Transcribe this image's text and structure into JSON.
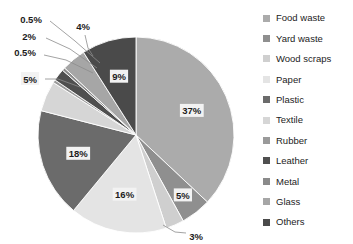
{
  "chart_data": {
    "type": "pie",
    "title": "",
    "categories": [
      "Food waste",
      "Yard waste",
      "Wood scraps",
      "Paper",
      "Plastic",
      "Textile",
      "Rubber",
      "Leather",
      "Metal",
      "Glass",
      "Others"
    ],
    "values": [
      37,
      5,
      3,
      16,
      18,
      5,
      0.5,
      2,
      0.5,
      4,
      9
    ],
    "value_labels": [
      "37%",
      "5%",
      "3%",
      "16%",
      "18%",
      "5%",
      "0.5%",
      "2%",
      "0.5%",
      "4%",
      "9%"
    ],
    "colors": [
      "#ababab",
      "#8f8f8f",
      "#cfcfcf",
      "#e4e4e4",
      "#6b6b6b",
      "#d6d6d6",
      "#9a9a9a",
      "#4f4f4f",
      "#8a8a8a",
      "#a6a6a6",
      "#4a4a4a"
    ],
    "start_angle_deg": 0,
    "direction": "clockwise",
    "legend_position": "right",
    "grid": false,
    "xlabel": "",
    "ylabel": ""
  },
  "legend": {
    "items": [
      {
        "label": "Food waste",
        "color": "#ababab"
      },
      {
        "label": "Yard waste",
        "color": "#8f8f8f"
      },
      {
        "label": "Wood scraps",
        "color": "#cfcfcf"
      },
      {
        "label": "Paper",
        "color": "#e4e4e4"
      },
      {
        "label": "Plastic",
        "color": "#6b6b6b"
      },
      {
        "label": "Textile",
        "color": "#d6d6d6"
      },
      {
        "label": "Rubber",
        "color": "#9a9a9a"
      },
      {
        "label": "Leather",
        "color": "#4f4f4f"
      },
      {
        "label": "Metal",
        "color": "#8a8a8a"
      },
      {
        "label": "Glass",
        "color": "#a6a6a6"
      },
      {
        "label": "Others",
        "color": "#4a4a4a"
      }
    ]
  },
  "callouts": {
    "rubber": "0.5%",
    "leather": "2%",
    "metal": "0.5%",
    "textile": "5%",
    "glass": "4%",
    "wood_scraps": "3%"
  }
}
